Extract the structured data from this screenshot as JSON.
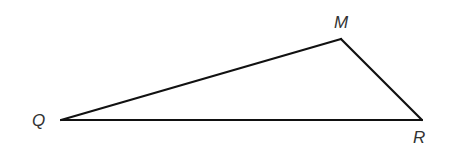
{
  "diagram": {
    "type": "triangle",
    "vertices": [
      {
        "name": "Q",
        "x": 61,
        "y": 120,
        "label_x": 32,
        "label_y": 126
      },
      {
        "name": "M",
        "x": 341,
        "y": 39,
        "label_x": 334,
        "label_y": 28
      },
      {
        "name": "R",
        "x": 422,
        "y": 120,
        "label_x": 413,
        "label_y": 143
      }
    ],
    "edges": [
      {
        "from": "Q",
        "to": "M"
      },
      {
        "from": "M",
        "to": "R"
      },
      {
        "from": "R",
        "to": "Q"
      }
    ],
    "colors": {
      "stroke": "#111111",
      "label": "#333333",
      "background": "#ffffff"
    }
  }
}
